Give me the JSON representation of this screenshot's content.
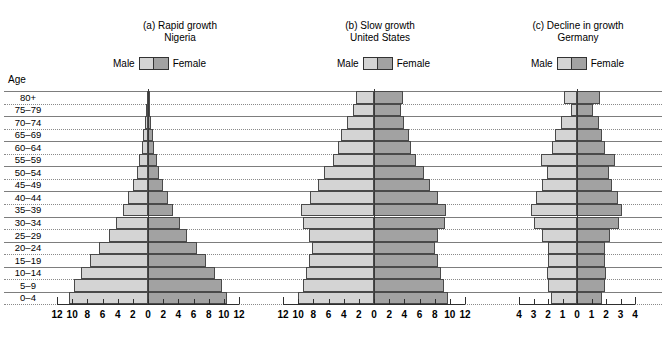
{
  "figure": {
    "age_axis_label": "Age",
    "age_groups": [
      "80+",
      "75–79",
      "70–74",
      "65–69",
      "60–64",
      "55–59",
      "50–54",
      "45–49",
      "40–44",
      "35–39",
      "30–34",
      "25–29",
      "20–24",
      "15–19",
      "10–14",
      "5–9",
      "0–4"
    ],
    "legend": {
      "male_label": "Male",
      "female_label": "Female"
    },
    "colors": {
      "male": "#d4d4d4",
      "female": "#a2a2a2",
      "outline": "#4a4a4a",
      "gridline": "#7d7d7d",
      "axis": "#2e2e2e"
    }
  },
  "chart_data": [
    {
      "type": "bar",
      "orientation": "population-pyramid",
      "panel": "(a)",
      "title": "(a) Rapid growth",
      "subtitle": "Nigeria",
      "xlabel": "",
      "ylabel": "Age",
      "categories": [
        "80+",
        "75–79",
        "70–74",
        "65–69",
        "60–64",
        "55–59",
        "50–54",
        "45–49",
        "40–44",
        "35–39",
        "30–34",
        "25–29",
        "20–24",
        "15–19",
        "10–14",
        "5–9",
        "0–4"
      ],
      "xlim": [
        -12,
        12
      ],
      "xticks": [
        12,
        10,
        8,
        6,
        4,
        2,
        0,
        2,
        4,
        6,
        8,
        10,
        12
      ],
      "xticklabels": [
        "12",
        "10",
        "8",
        "6",
        "4",
        "2",
        "0",
        "2",
        "4",
        "6",
        "8",
        "10",
        "12"
      ],
      "grid": true,
      "legend_position": "above-plot",
      "series": [
        {
          "name": "Male",
          "values": [
            0.15,
            0.25,
            0.4,
            0.6,
            0.85,
            1.2,
            1.5,
            2.0,
            2.6,
            3.3,
            4.2,
            5.2,
            6.4,
            7.6,
            8.8,
            9.8,
            10.4
          ]
        },
        {
          "name": "Female",
          "values": [
            0.15,
            0.25,
            0.4,
            0.6,
            0.85,
            1.2,
            1.5,
            2.0,
            2.6,
            3.3,
            4.2,
            5.2,
            6.4,
            7.6,
            8.8,
            9.8,
            10.4
          ]
        }
      ]
    },
    {
      "type": "bar",
      "orientation": "population-pyramid",
      "panel": "(b)",
      "title": "(b) Slow growth",
      "subtitle": "United States",
      "xlabel": "",
      "ylabel": "Age",
      "categories": [
        "80+",
        "75–79",
        "70–74",
        "65–69",
        "60–64",
        "55–59",
        "50–54",
        "45–49",
        "40–44",
        "35–39",
        "30–34",
        "25–29",
        "20–24",
        "15–19",
        "10–14",
        "5–9",
        "0–4"
      ],
      "xlim": [
        -12,
        12
      ],
      "xticks": [
        12,
        10,
        8,
        6,
        4,
        2,
        0,
        2,
        4,
        6,
        8,
        10,
        12
      ],
      "xticklabels": [
        "12",
        "10",
        "8",
        "6",
        "4",
        "2",
        "0",
        "2",
        "4",
        "6",
        "8",
        "10",
        "12"
      ],
      "grid": true,
      "legend_position": "above-plot",
      "series": [
        {
          "name": "Male",
          "values": [
            2.4,
            2.8,
            3.6,
            4.4,
            4.8,
            5.4,
            6.6,
            7.4,
            8.4,
            9.6,
            9.4,
            8.6,
            8.2,
            8.6,
            9.0,
            9.4,
            10.0
          ]
        },
        {
          "name": "Female",
          "values": [
            3.8,
            3.6,
            4.0,
            4.6,
            4.9,
            5.5,
            6.6,
            7.4,
            8.4,
            9.5,
            9.3,
            8.5,
            8.1,
            8.4,
            8.8,
            9.2,
            9.8
          ]
        }
      ]
    },
    {
      "type": "bar",
      "orientation": "population-pyramid",
      "panel": "(c)",
      "title": "(c) Decline in growth",
      "subtitle": "Germany",
      "xlabel": "",
      "ylabel": "Age",
      "categories": [
        "80+",
        "75–79",
        "70–74",
        "65–69",
        "60–64",
        "55–59",
        "50–54",
        "45–49",
        "40–44",
        "35–39",
        "30–34",
        "25–29",
        "20–24",
        "15–19",
        "10–14",
        "5–9",
        "0–4"
      ],
      "xlim": [
        -4,
        4
      ],
      "xticks": [
        4,
        3,
        2,
        1,
        0,
        1,
        2,
        3,
        4
      ],
      "xticklabels": [
        "4",
        "3",
        "2",
        "1",
        "0",
        "1",
        "2",
        "3",
        "4"
      ],
      "grid": true,
      "legend_position": "above-plot",
      "series": [
        {
          "name": "Male",
          "values": [
            0.9,
            0.4,
            1.1,
            1.5,
            1.7,
            2.5,
            2.1,
            2.4,
            2.8,
            3.2,
            3.0,
            2.4,
            2.0,
            2.0,
            2.1,
            2.0,
            1.8
          ]
        },
        {
          "name": "Female",
          "values": [
            1.6,
            1.1,
            1.5,
            1.7,
            1.9,
            2.6,
            2.2,
            2.4,
            2.8,
            3.1,
            2.9,
            2.3,
            1.9,
            1.9,
            2.0,
            1.9,
            1.7
          ]
        }
      ]
    }
  ]
}
